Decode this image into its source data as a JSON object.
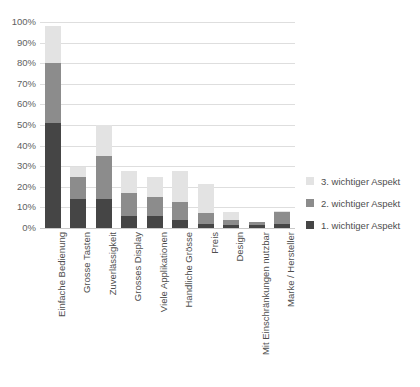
{
  "chart_data": {
    "type": "bar",
    "stacked": true,
    "title": "",
    "xlabel": "",
    "ylabel": "",
    "ylim": [
      0,
      100
    ],
    "yunit": "%",
    "grid": true,
    "legend_position": "right",
    "categories": [
      "Einfache Bedienung",
      "Grosse Tasten",
      "Zuverlässigkeit",
      "Grosses Display",
      "Viele Applikationen",
      "Handliche Grösse",
      "Preis",
      "Design",
      "Mit Einschränkungen nutzbar",
      "Marke / Hersteller"
    ],
    "y_ticks": [
      "0%",
      "10%",
      "20%",
      "30%",
      "40%",
      "50%",
      "60%",
      "70%",
      "80%",
      "90%",
      "100%"
    ],
    "y_tick_values": [
      0,
      10,
      20,
      30,
      40,
      50,
      60,
      70,
      80,
      90,
      100
    ],
    "series": [
      {
        "name": "1. wichtiger Aspekt",
        "color": "#454545",
        "values": [
          51,
          14,
          14,
          6,
          6,
          4,
          2,
          1.5,
          1.5,
          2
        ]
      },
      {
        "name": "2. wichtiger Aspekt",
        "color": "#8c8c8c",
        "values": [
          29,
          11,
          21,
          11,
          9,
          8.5,
          5.5,
          2.5,
          1.5,
          6
        ]
      },
      {
        "name": "3. wichtiger Aspekt",
        "color": "#e3e3e3",
        "values": [
          18,
          4.5,
          15,
          10.5,
          10,
          15,
          14,
          4,
          0,
          0.5
        ]
      }
    ],
    "legend_order": [
      "3. wichtiger Aspekt",
      "2. wichtiger Aspekt",
      "1. wichtiger Aspekt"
    ],
    "totals": [
      98,
      29.5,
      50,
      27.5,
      25,
      27.5,
      21.5,
      8,
      3,
      8.5
    ]
  },
  "colors": {
    "series1": "#454545",
    "series2": "#8c8c8c",
    "series3": "#e3e3e3",
    "gridline": "#dedede",
    "axis": "#c9c9c9",
    "text": "#4e4e4e",
    "background": "#ffffff"
  }
}
